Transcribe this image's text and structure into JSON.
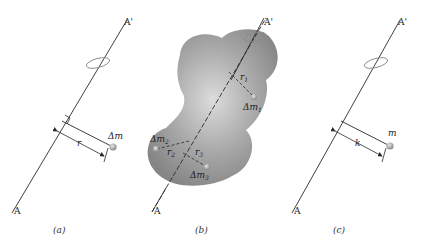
{
  "panels": [
    {
      "caption": "(a)",
      "axis_top_label": "A'",
      "axis_bottom_label": "A",
      "mass_label": "Δm",
      "distance_label": "r"
    },
    {
      "caption": "(b)",
      "axis_top_label": "A'",
      "axis_bottom_label": "A",
      "elements": [
        {
          "mass_label": "Δm",
          "mass_sub": "1",
          "distance_label": "r",
          "distance_sub": "1"
        },
        {
          "mass_label": "Δm",
          "mass_sub": "2",
          "distance_label": "r",
          "distance_sub": "2"
        },
        {
          "mass_label": "Δm",
          "mass_sub": "3",
          "distance_label": "r",
          "distance_sub": "3"
        }
      ]
    },
    {
      "caption": "(c)",
      "axis_top_label": "A'",
      "axis_bottom_label": "A",
      "mass_label": "m",
      "distance_label": "k"
    }
  ],
  "colors": {
    "line": "#2a2a2a",
    "body_fill": "#9a9a9a",
    "body_highlight": "#d8d8d8",
    "mass_dot": "#a8a8a8",
    "rotation_arrow": "#8a8a8a"
  }
}
